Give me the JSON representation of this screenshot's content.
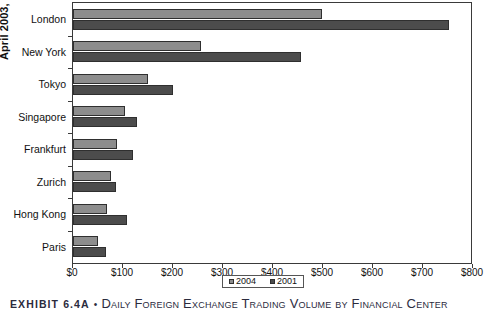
{
  "chart_data": {
    "type": "bar",
    "orientation": "horizontal",
    "title": "",
    "xlabel": "",
    "ylabel": "April 2003, billions",
    "xlim": [
      0,
      800
    ],
    "xticks": [
      0,
      100,
      200,
      300,
      400,
      500,
      600,
      700,
      800
    ],
    "xtick_labels": [
      "$0",
      "$100",
      "$200",
      "$300",
      "$400",
      "$500",
      "$600",
      "$700",
      "$800"
    ],
    "grid": false,
    "legend_position": "bottom-right",
    "categories": [
      "London",
      "New York",
      "Tokyo",
      "Singapore",
      "Frankfurt",
      "Zurich",
      "Hong Kong",
      "Paris"
    ],
    "series": [
      {
        "name": "2004",
        "color": "#8d8d8d",
        "values": [
          498,
          256,
          150,
          104,
          88,
          76,
          68,
          50
        ]
      },
      {
        "name": "2001",
        "color": "#4c4c4c",
        "values": [
          752,
          456,
          200,
          128,
          120,
          86,
          108,
          66
        ]
      }
    ]
  },
  "axis": {
    "y_title": "April 2003, billions"
  },
  "legend": {
    "items": [
      {
        "label": "2004",
        "color": "#8d8d8d"
      },
      {
        "label": "2001",
        "color": "#4c4c4c"
      }
    ]
  },
  "caption": {
    "exhibit": "EXHIBIT 6.4A",
    "separator": "•",
    "title": "Daily Foreign Exchange Trading Volume by Financial Center"
  },
  "colors": {
    "series_2004": "#8d8d8d",
    "series_2001": "#4c4c4c",
    "axis": "#3a3a3a",
    "text": "#111111",
    "caption_text": "#2b2b3d"
  }
}
